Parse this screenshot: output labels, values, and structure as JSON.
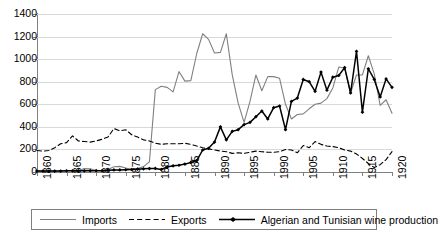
{
  "chart_data": {
    "type": "line",
    "title": "",
    "subtitle": "",
    "xlabel": "",
    "ylabel": "",
    "xlim": [
      1860,
      1920
    ],
    "ylim": [
      0,
      1400
    ],
    "ytick_step": 200,
    "xtick_step": 5,
    "grid": "horizontal",
    "legend_position": "bottom",
    "y_ticks": [
      "0",
      "200",
      "400",
      "600",
      "800",
      "1000",
      "1200",
      "1400"
    ],
    "x_ticks": [
      "1860",
      "1865",
      "1870",
      "1875",
      "1880",
      "1885",
      "1990",
      "1905",
      "1910",
      "1915",
      "1920"
    ],
    "x_tick_years": [
      1860,
      1865,
      1870,
      1875,
      1880,
      1885,
      1895,
      1900,
      1905,
      1910,
      1915,
      1920
    ],
    "x_tick_labels_rendered": [
      "1860",
      "1865",
      "1870",
      "1875",
      "1880",
      "1885",
      "1890",
      "1895",
      "1990",
      "1905",
      "1910",
      "1915",
      "1920"
    ],
    "note_on_labels": "The tick that should read 1900 is printed as 1990 in the source figure.",
    "x": [
      1860,
      1861,
      1862,
      1863,
      1864,
      1865,
      1866,
      1867,
      1868,
      1869,
      1870,
      1871,
      1872,
      1873,
      1874,
      1875,
      1876,
      1877,
      1878,
      1879,
      1880,
      1881,
      1882,
      1883,
      1884,
      1885,
      1886,
      1887,
      1888,
      1889,
      1890,
      1891,
      1892,
      1893,
      1894,
      1895,
      1896,
      1897,
      1898,
      1899,
      1900,
      1901,
      1902,
      1903,
      1904,
      1905,
      1906,
      1907,
      1908,
      1909,
      1910,
      1911,
      1912,
      1913,
      1914,
      1915,
      1916,
      1917,
      1918,
      1919,
      1920
    ],
    "series": [
      {
        "name": "Imports",
        "style": "solid",
        "color": "#808080",
        "marker": "none",
        "values": [
          8,
          8,
          8,
          8,
          10,
          10,
          12,
          14,
          30,
          28,
          14,
          12,
          22,
          46,
          50,
          36,
          22,
          30,
          48,
          90,
          730,
          760,
          750,
          710,
          890,
          805,
          810,
          1050,
          1225,
          1175,
          1055,
          1060,
          1225,
          860,
          610,
          440,
          625,
          860,
          720,
          845,
          845,
          830,
          600,
          470,
          510,
          515,
          560,
          600,
          610,
          650,
          745,
          930,
          920,
          700,
          860,
          860,
          1030,
          870,
          590,
          640,
          520
        ]
      },
      {
        "name": "Exports",
        "style": "dashed",
        "color": "#000000",
        "marker": "none",
        "values": [
          190,
          185,
          190,
          215,
          250,
          260,
          320,
          275,
          270,
          265,
          275,
          290,
          310,
          385,
          365,
          375,
          330,
          310,
          285,
          275,
          255,
          245,
          250,
          250,
          250,
          255,
          245,
          230,
          215,
          205,
          195,
          185,
          180,
          165,
          170,
          165,
          175,
          185,
          180,
          175,
          175,
          180,
          200,
          195,
          170,
          235,
          215,
          270,
          245,
          230,
          225,
          215,
          195,
          185,
          160,
          120,
          75,
          40,
          65,
          110,
          180
        ]
      },
      {
        "name": "Algerian and Tunisian wine production",
        "style": "solid",
        "color": "#000000",
        "marker": "diamond",
        "values": [
          8,
          8,
          8,
          8,
          8,
          10,
          10,
          10,
          10,
          12,
          12,
          12,
          15,
          18,
          18,
          20,
          22,
          25,
          28,
          30,
          32,
          22,
          45,
          55,
          60,
          70,
          85,
          100,
          195,
          210,
          265,
          400,
          285,
          360,
          375,
          420,
          440,
          490,
          540,
          470,
          570,
          585,
          375,
          625,
          655,
          820,
          800,
          715,
          885,
          725,
          840,
          855,
          925,
          700,
          1070,
          530,
          915,
          820,
          665,
          825,
          750
        ]
      }
    ]
  },
  "legend": {
    "items": [
      {
        "label": "Imports",
        "marker": "line-solid-gray"
      },
      {
        "label": "Exports",
        "marker": "line-dashed-black"
      },
      {
        "label": "Algerian and Tunisian wine production",
        "marker": "line-solid-black-diamond"
      }
    ]
  }
}
